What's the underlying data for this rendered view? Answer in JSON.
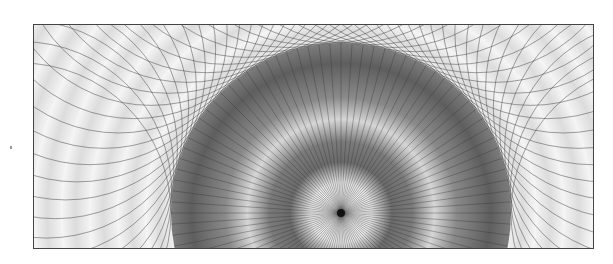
{
  "image": {
    "description": "Abstract geometric pattern: concentric dark-to-light radial gradient disc centered near bottom, radiating lines, and overlapping circle envelope lines on a light textured background within a thin dark frame",
    "colors": {
      "frame_border": "#444444",
      "background_light": "#f0f0f0",
      "disc_dark": "#5a5a5a",
      "center_dot": "#111111",
      "lines": "#333333"
    },
    "geometry": {
      "center": [
        307,
        188
      ],
      "inner_disc_radius": 170,
      "ray_count": 96
    }
  }
}
